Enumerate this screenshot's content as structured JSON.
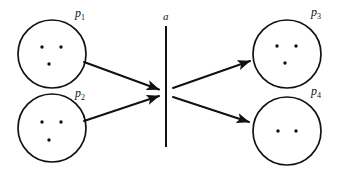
{
  "figure": {
    "type": "particle-interaction-diagram",
    "background_color": "#ffffff",
    "stroke_color": "#111111",
    "width": 339,
    "height": 178
  },
  "barrier": {
    "label": "a",
    "name": "interaction-barrier",
    "x": 166,
    "y_top": 26,
    "y_bottom": 147,
    "label_x": 163,
    "label_y": 20
  },
  "nodes": [
    {
      "id": "p1",
      "label": "p",
      "subscript": "1",
      "cx": 52,
      "cy": 54,
      "r": 34,
      "label_x": 75,
      "label_y": 17,
      "dot_count": 3,
      "dots": [
        {
          "x": 42,
          "y": 47
        },
        {
          "x": 61,
          "y": 47
        },
        {
          "x": 49,
          "y": 64
        }
      ]
    },
    {
      "id": "p2",
      "label": "p",
      "subscript": "2",
      "cx": 52,
      "cy": 128,
      "r": 34,
      "label_x": 75,
      "label_y": 97,
      "dot_count": 3,
      "dots": [
        {
          "x": 42,
          "y": 122
        },
        {
          "x": 61,
          "y": 122
        },
        {
          "x": 49,
          "y": 140
        }
      ]
    },
    {
      "id": "p3",
      "label": "p",
      "subscript": "3",
      "cx": 287,
      "cy": 54,
      "r": 34,
      "label_x": 311,
      "label_y": 16,
      "dot_count": 3,
      "dots": [
        {
          "x": 277,
          "y": 46
        },
        {
          "x": 296,
          "y": 46
        },
        {
          "x": 285,
          "y": 63
        }
      ]
    },
    {
      "id": "p4",
      "label": "p",
      "subscript": "4",
      "cx": 287,
      "cy": 131,
      "r": 34,
      "label_x": 311,
      "label_y": 95,
      "dot_count": 2,
      "dots": [
        {
          "x": 278,
          "y": 131
        },
        {
          "x": 296,
          "y": 131
        }
      ]
    }
  ],
  "arrows": [
    {
      "id": "arrow-p1-to-barrier",
      "from": "p1",
      "to": "barrier",
      "x1": 84,
      "y1": 62,
      "x2": 160,
      "y2": 90,
      "direction": "incoming"
    },
    {
      "id": "arrow-p2-to-barrier",
      "from": "p2",
      "to": "barrier",
      "x1": 84,
      "y1": 121,
      "x2": 160,
      "y2": 96,
      "direction": "incoming"
    },
    {
      "id": "arrow-barrier-to-p3",
      "from": "barrier",
      "to": "p3",
      "x1": 173,
      "y1": 88,
      "x2": 252,
      "y2": 60,
      "direction": "outgoing"
    },
    {
      "id": "arrow-barrier-to-p4",
      "from": "barrier",
      "to": "p4",
      "x1": 173,
      "y1": 97,
      "x2": 251,
      "y2": 123,
      "direction": "outgoing"
    }
  ]
}
